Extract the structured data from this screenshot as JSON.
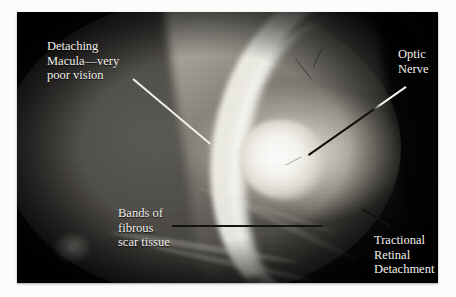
{
  "figure": {
    "type": "fundus-photograph",
    "frame": {
      "x": 17,
      "y": 12,
      "width": 421,
      "height": 271,
      "background_color": "#070707"
    },
    "label_color": "#f2f0ea"
  },
  "annotations": [
    {
      "id": "detaching-macula",
      "text": "Detaching\nMacula—very\npoor vision",
      "lines": [
        "Detaching",
        "Macula—very",
        "poor vision"
      ],
      "text_x": 30,
      "text_y": 27,
      "leader": {
        "from": [
          116,
          66
        ],
        "to": [
          193,
          131
        ],
        "color": "#f3f1ea",
        "style": "light"
      }
    },
    {
      "id": "optic-nerve",
      "text": "Optic\nNerve",
      "lines": [
        "Optic",
        "Nerve"
      ],
      "text_x": 381,
      "text_y": 35,
      "leader": {
        "from": [
          389,
          74
        ],
        "to": [
          292,
          142
        ],
        "color": "#100f0c",
        "style": "light-to-dark"
      }
    },
    {
      "id": "bands-of-fibrous-scar-tissue",
      "text": "Bands of\nfibrous\nscar tissue",
      "lines": [
        "Bands of",
        "fibrous",
        "scar tissue"
      ],
      "text_x": 101,
      "text_y": 194,
      "leader": {
        "from": [
          155,
          214
        ],
        "to": [
          305,
          214
        ],
        "color": "#14130f",
        "style": "dark"
      }
    },
    {
      "id": "tractional-retinal-detachment",
      "text": "Tractional\nRetinal\nDetachment",
      "lines": [
        "Tractional",
        "Retinal",
        "Detachment"
      ],
      "text_x": 357,
      "text_y": 221,
      "leader": {
        "from": [
          345,
          196
        ],
        "to": [
          373,
          213
        ],
        "color": "#14130f",
        "style": "dark"
      }
    }
  ]
}
